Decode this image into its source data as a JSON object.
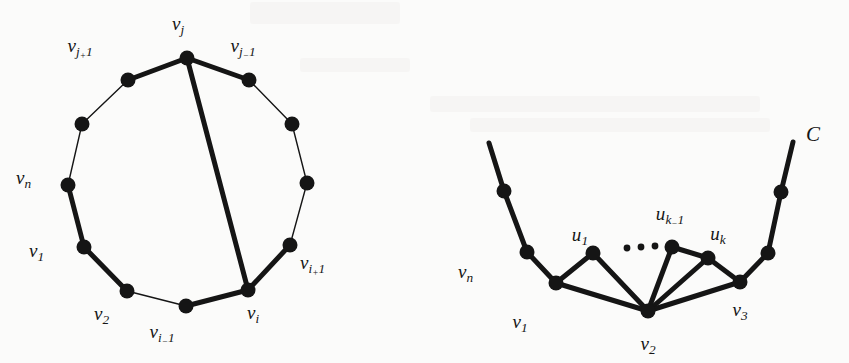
{
  "figure": {
    "background_color": "#fbfbfa",
    "ink_color": "#151515",
    "thick_edge_width": 5.0,
    "thin_edge_width": 1.4,
    "vertex_radius": 7.5
  },
  "left_diagram": {
    "name": "cycle-with-chord",
    "description": "Cycle on n vertices drawn as a polygon with a thick chord from v_j to v_i",
    "labels": [
      {
        "id": "vj",
        "base": "v",
        "sub": "j",
        "text": "v_j",
        "x": 178,
        "y": 14,
        "align": "center"
      },
      {
        "id": "vj1",
        "base": "v",
        "sub": "j+1",
        "text": "v_j+1",
        "x": 80,
        "y": 36,
        "align": "center"
      },
      {
        "id": "vjm1",
        "base": "v",
        "sub": "j-1",
        "text": "v_j-1",
        "x": 243,
        "y": 36,
        "align": "center"
      },
      {
        "id": "vn",
        "base": "v",
        "sub": "n",
        "text": "v_n",
        "x": 16,
        "y": 168,
        "align": "left"
      },
      {
        "id": "v1",
        "base": "v",
        "sub": "1",
        "text": "v_1",
        "x": 29,
        "y": 241,
        "align": "left"
      },
      {
        "id": "v2",
        "base": "v",
        "sub": "2",
        "text": "v_2",
        "x": 94,
        "y": 304,
        "align": "left"
      },
      {
        "id": "vim1",
        "base": "v",
        "sub": "i-1",
        "text": "v_i-1",
        "x": 162,
        "y": 322,
        "align": "center"
      },
      {
        "id": "vi",
        "base": "v",
        "sub": "i",
        "text": "v_i",
        "x": 253,
        "y": 303,
        "align": "center"
      },
      {
        "id": "vip1",
        "base": "v",
        "sub": "i+1",
        "text": "v_i+1",
        "x": 300,
        "y": 253,
        "align": "left"
      }
    ],
    "vertices": [
      {
        "id": "vj",
        "x": 187,
        "y": 58,
        "labeled": true
      },
      {
        "id": "vjm1",
        "x": 249,
        "y": 80,
        "labeled": true
      },
      {
        "id": "bend1",
        "x": 292,
        "y": 124,
        "labeled": false
      },
      {
        "id": "bend2",
        "x": 307,
        "y": 183,
        "labeled": false
      },
      {
        "id": "vip1",
        "x": 290,
        "y": 245,
        "labeled": true
      },
      {
        "id": "vi",
        "x": 248,
        "y": 290,
        "labeled": true
      },
      {
        "id": "vim1",
        "x": 186,
        "y": 306,
        "labeled": true
      },
      {
        "id": "v2",
        "x": 127,
        "y": 291,
        "labeled": true
      },
      {
        "id": "v1",
        "x": 84,
        "y": 247,
        "labeled": true
      },
      {
        "id": "vn",
        "x": 68,
        "y": 185,
        "labeled": true
      },
      {
        "id": "bend3",
        "x": 82,
        "y": 124,
        "labeled": false
      },
      {
        "id": "vj1",
        "x": 128,
        "y": 80,
        "labeled": true
      }
    ],
    "edges": [
      {
        "from": "vj",
        "to": "vjm1",
        "weight": "thick"
      },
      {
        "from": "vjm1",
        "to": "bend1",
        "weight": "thin"
      },
      {
        "from": "bend1",
        "to": "bend2",
        "weight": "thin"
      },
      {
        "from": "bend2",
        "to": "vip1",
        "weight": "thin"
      },
      {
        "from": "vip1",
        "to": "vi",
        "weight": "thick"
      },
      {
        "from": "vi",
        "to": "vim1",
        "weight": "thick"
      },
      {
        "from": "vim1",
        "to": "v2",
        "weight": "thin"
      },
      {
        "from": "v2",
        "to": "v1",
        "weight": "thick"
      },
      {
        "from": "v1",
        "to": "vn",
        "weight": "thick"
      },
      {
        "from": "vn",
        "to": "bend3",
        "weight": "thin"
      },
      {
        "from": "bend3",
        "to": "vj1",
        "weight": "thin"
      },
      {
        "from": "vj1",
        "to": "vj",
        "weight": "thick"
      },
      {
        "from": "vj",
        "to": "vi",
        "weight": "thick",
        "kind": "chord"
      }
    ]
  },
  "right_diagram": {
    "name": "cycle-arc-with-fan",
    "description": "Portion of cycle C with vertices u_1 ... u_k fanning to v_2",
    "cycle_label": {
      "id": "C",
      "text": "C",
      "x": 806,
      "y": 124
    },
    "labels": [
      {
        "id": "vn",
        "base": "v",
        "sub": "n",
        "text": "v_n",
        "x": 458,
        "y": 262,
        "align": "left"
      },
      {
        "id": "v1",
        "base": "v",
        "sub": "1",
        "text": "v_1",
        "x": 520,
        "y": 312,
        "align": "center"
      },
      {
        "id": "v2",
        "base": "v",
        "sub": "2",
        "text": "v_2",
        "x": 648,
        "y": 334,
        "align": "center"
      },
      {
        "id": "v3",
        "base": "v",
        "sub": "3",
        "text": "v_3",
        "x": 740,
        "y": 300,
        "align": "center"
      },
      {
        "id": "u1",
        "base": "u",
        "sub": "1",
        "text": "u_1",
        "x": 580,
        "y": 225,
        "align": "center"
      },
      {
        "id": "ukm1",
        "base": "u",
        "sub": "k-1",
        "text": "u_k-1",
        "x": 670,
        "y": 204,
        "align": "center"
      },
      {
        "id": "uk",
        "base": "u",
        "sub": "k",
        "text": "u_k",
        "x": 718,
        "y": 224,
        "align": "center"
      }
    ],
    "vertices": [
      {
        "id": "arcL_top",
        "x": 504,
        "y": 191,
        "labeled": false
      },
      {
        "id": "arcL_mid",
        "x": 527,
        "y": 252,
        "labeled": false
      },
      {
        "id": "v1",
        "x": 556,
        "y": 283,
        "labeled": true
      },
      {
        "id": "u1",
        "x": 593,
        "y": 253,
        "labeled": true
      },
      {
        "id": "ukm1",
        "x": 672,
        "y": 247,
        "labeled": true
      },
      {
        "id": "uk",
        "x": 708,
        "y": 258,
        "labeled": true
      },
      {
        "id": "v2",
        "x": 648,
        "y": 311,
        "labeled": true
      },
      {
        "id": "v3",
        "x": 740,
        "y": 282,
        "labeled": true
      },
      {
        "id": "arcR_mid",
        "x": 768,
        "y": 253,
        "labeled": false
      },
      {
        "id": "arcR_top",
        "x": 781,
        "y": 192,
        "labeled": false
      }
    ],
    "arc_ends": [
      {
        "id": "arcL_end",
        "x": 489,
        "y": 143
      },
      {
        "id": "arcR_end",
        "x": 793,
        "y": 142
      }
    ],
    "edges": [
      {
        "from": "arcL_end",
        "to": "arcL_top",
        "weight": "thick"
      },
      {
        "from": "arcL_top",
        "to": "arcL_mid",
        "weight": "thick"
      },
      {
        "from": "arcL_mid",
        "to": "v1",
        "weight": "thick"
      },
      {
        "from": "v1",
        "to": "u1",
        "weight": "thick"
      },
      {
        "from": "u1",
        "to": "v2",
        "weight": "thick"
      },
      {
        "from": "v1",
        "to": "v2",
        "weight": "thick"
      },
      {
        "from": "v2",
        "to": "ukm1",
        "weight": "thick"
      },
      {
        "from": "ukm1",
        "to": "uk",
        "weight": "thick"
      },
      {
        "from": "uk",
        "to": "v2",
        "weight": "thick"
      },
      {
        "from": "uk",
        "to": "v3",
        "weight": "thick"
      },
      {
        "from": "v2",
        "to": "v3",
        "weight": "thick"
      },
      {
        "from": "v3",
        "to": "arcR_mid",
        "weight": "thick"
      },
      {
        "from": "arcR_mid",
        "to": "arcR_top",
        "weight": "thick"
      },
      {
        "from": "arcR_top",
        "to": "arcR_end",
        "weight": "thick"
      }
    ],
    "ellipsis": {
      "name": "ellipsis-dots",
      "dots": [
        {
          "x": 627,
          "y": 248,
          "r": 3.4
        },
        {
          "x": 641,
          "y": 247,
          "r": 3.4
        },
        {
          "x": 655,
          "y": 246,
          "r": 3.4
        }
      ]
    }
  }
}
